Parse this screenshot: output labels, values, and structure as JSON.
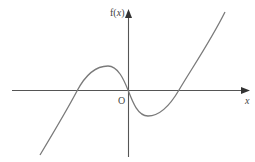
{
  "diagram": {
    "type": "function-graph",
    "labels": {
      "y_axis_prefix": "f(",
      "y_axis_var": "x",
      "y_axis_suffix": ")",
      "x_axis": "x",
      "origin": "O"
    },
    "colors": {
      "axis": "#555555",
      "curve": "#7a7a7a",
      "arrow": "#333333",
      "background": "#ffffff"
    },
    "features": {
      "roots": [
        "negative root",
        "origin",
        "positive root"
      ],
      "local_maximum": "left of y-axis, above x-axis",
      "local_minimum": "right of y-axis, below x-axis"
    }
  }
}
